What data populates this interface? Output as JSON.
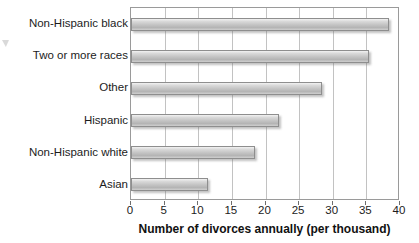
{
  "chart_data": {
    "type": "bar",
    "orientation": "horizontal",
    "title": "",
    "xlabel": "Number of divorces annually (per thousand)",
    "ylabel": "",
    "categories": [
      "Non-Hispanic black",
      "Two or more races",
      "Other",
      "Hispanic",
      "Non-Hispanic white",
      "Asian"
    ],
    "values": [
      38.4,
      35.4,
      28.4,
      22.0,
      18.4,
      11.5
    ],
    "xlim": [
      0,
      40
    ],
    "xticks": [
      0,
      5,
      10,
      15,
      20,
      25,
      30,
      35,
      40
    ],
    "xtick_labels": [
      "0",
      "5",
      "10",
      "15",
      "20",
      "25",
      "30",
      "35",
      "40"
    ],
    "grid": "vertical",
    "legend": "none",
    "bar_color": "#c4c4c4",
    "bar_edge_color": "#8e8e8e",
    "gridline_color": "#c2c2c2",
    "frame_color": "#9a9a9a",
    "text_color": "#1c1c1c"
  }
}
